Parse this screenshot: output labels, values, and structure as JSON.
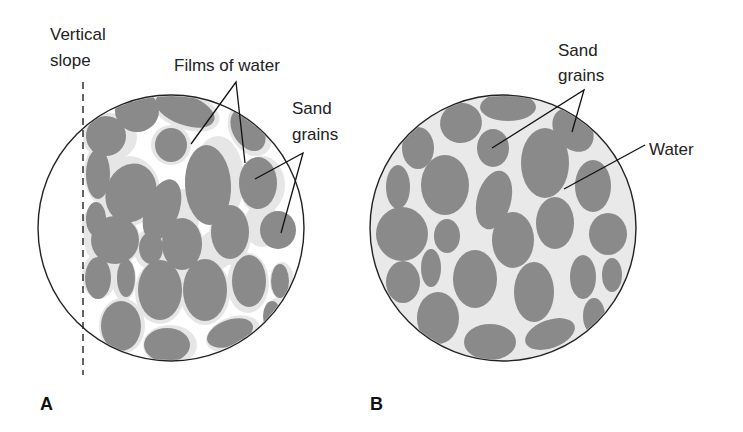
{
  "figure": {
    "panels": [
      {
        "id": "A",
        "label": "A",
        "labels": {
          "vertical_slope_line1": "Vertical",
          "vertical_slope_line2": "slope",
          "films_of_water": "Films of water",
          "sand_grains_line1": "Sand",
          "sand_grains_line2": "grains"
        },
        "description": "Moist sand: grains held by thin films of water, can stand at vertical slope"
      },
      {
        "id": "B",
        "label": "B",
        "labels": {
          "sand_grains_line1": "Sand",
          "sand_grains_line2": "grains",
          "water": "Water"
        },
        "description": "Saturated sand: pore spaces completely filled with water"
      }
    ],
    "colors": {
      "grain": "#8a8a8a",
      "water_film": "#e6e6e6",
      "water_fill": "#e9e9e9",
      "outline": "#222222",
      "background": "#ffffff"
    }
  }
}
